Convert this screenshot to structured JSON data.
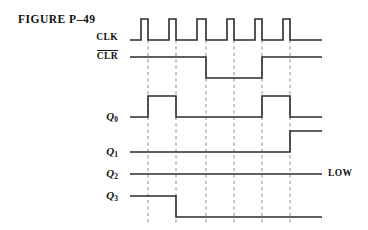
{
  "figure": {
    "title": "FIGURE P–49",
    "background_color": "#ffffff",
    "line_color": "#2b2b2b",
    "dashed_line_color": "#8c8c8c",
    "text_color": "#111111"
  },
  "labels": {
    "clk": "CLK",
    "clr": "CLR",
    "clr_overlined": true,
    "q0": "Q",
    "q0_sub": "0",
    "q1": "Q",
    "q1_sub": "1",
    "q2": "Q",
    "q2_sub": "2",
    "q3": "Q",
    "q3_sub": "3",
    "low_note": "LOW"
  },
  "chart_data": {
    "type": "line",
    "title": "FIGURE P–49",
    "xlabel": "",
    "ylabel": "",
    "grid": true,
    "legend_position": "left",
    "axis": {
      "x_start_px": 130,
      "x_end_px": 322,
      "clock_period_px": 28
    },
    "gridlines_x_px": [
      148,
      176,
      206,
      234,
      262,
      290
    ],
    "series": [
      {
        "name": "CLK",
        "row_index": 0,
        "low_y_px": 40,
        "high_y_px": 19,
        "initial_level": "low",
        "pulse_count": 6,
        "transitions_px": [
          {
            "x": 141,
            "level": "high"
          },
          {
            "x": 148,
            "level": "low"
          },
          {
            "x": 169,
            "level": "high"
          },
          {
            "x": 176,
            "level": "low"
          },
          {
            "x": 197,
            "level": "high"
          },
          {
            "x": 206,
            "level": "low"
          },
          {
            "x": 227,
            "level": "high"
          },
          {
            "x": 234,
            "level": "low"
          },
          {
            "x": 255,
            "level": "high"
          },
          {
            "x": 262,
            "level": "low"
          },
          {
            "x": 283,
            "level": "high"
          },
          {
            "x": 290,
            "level": "low"
          }
        ]
      },
      {
        "name": "CLR",
        "row_index": 1,
        "low_y_px": 78,
        "high_y_px": 57,
        "initial_level": "high",
        "transitions_px": [
          {
            "x": 206,
            "level": "low"
          },
          {
            "x": 262,
            "level": "high"
          }
        ]
      },
      {
        "name": "Q0",
        "row_index": 2,
        "low_y_px": 117,
        "high_y_px": 96,
        "initial_level": "low",
        "transitions_px": [
          {
            "x": 148,
            "level": "high"
          },
          {
            "x": 176,
            "level": "low"
          },
          {
            "x": 262,
            "level": "high"
          },
          {
            "x": 290,
            "level": "low"
          }
        ]
      },
      {
        "name": "Q1",
        "row_index": 3,
        "low_y_px": 152,
        "high_y_px": 131,
        "initial_level": "low",
        "transitions_px": [
          {
            "x": 290,
            "level": "high"
          }
        ]
      },
      {
        "name": "Q2",
        "row_index": 4,
        "low_y_px": 174,
        "high_y_px": 174,
        "initial_level": "low",
        "transitions_px": [],
        "annotation": "LOW"
      },
      {
        "name": "Q3",
        "row_index": 5,
        "low_y_px": 217,
        "high_y_px": 196,
        "initial_level": "high",
        "transitions_px": [
          {
            "x": 176,
            "level": "low"
          }
        ]
      }
    ]
  }
}
